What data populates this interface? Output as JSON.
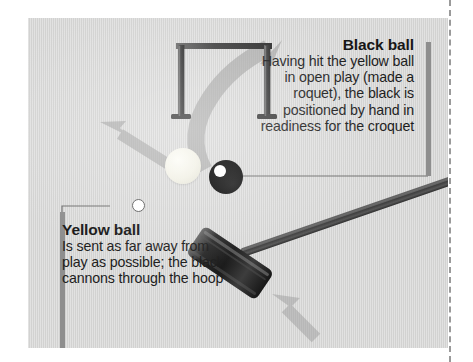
{
  "figure": {
    "kind": "croquet-roquet-diagram",
    "panel_background": "#d5d5d4",
    "page_background": "#ffffff"
  },
  "callouts": [
    {
      "id": "black-ball",
      "heading": "Black ball",
      "body": "Having hit the yellow ball in open play (made a roquet), the black is positioned by hand in readiness for the croquet",
      "align": "right",
      "bar_color": "#8e8e8e",
      "leader": "horizontal-line-to-black-ball"
    },
    {
      "id": "yellow-ball",
      "heading": "Yellow ball",
      "body": "Is sent as far away from play as possible; the black cannons through the hoop",
      "align": "left",
      "bar_color": "#8e8e8e",
      "leader": "line-to-dot-beside-yellow-ball"
    }
  ],
  "objects": {
    "hoop": {
      "name": "croquet-hoop",
      "color": "#4b4b4b"
    },
    "mallet": {
      "name": "croquet-mallet",
      "head_color": "#2e2e2e",
      "shaft_color": "#4d4d4d"
    },
    "yellow_ball": {
      "name": "yellow-ball",
      "color": "#f4f3e8"
    },
    "black_ball": {
      "name": "black-ball",
      "color": "#000000",
      "highlight": "#ffffff"
    }
  },
  "arrows": [
    {
      "name": "black-ball-path-arrow",
      "direction": "curving-up-through-hoop",
      "color": "#a9a9a9"
    },
    {
      "name": "yellow-ball-path-arrow",
      "direction": "up-left-away-from-play",
      "color": "#a9a9a9"
    },
    {
      "name": "mallet-swing-arrow",
      "direction": "up-left-into-mallet-head",
      "color": "#bcbcbc"
    }
  ]
}
